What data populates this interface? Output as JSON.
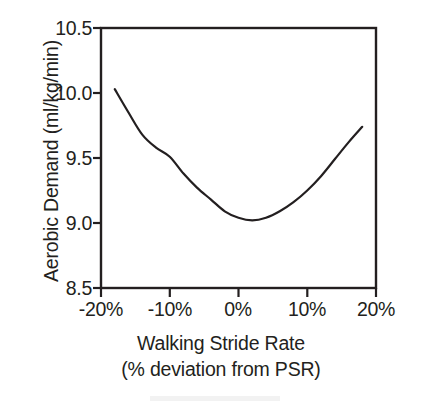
{
  "chart_data": {
    "type": "line",
    "title": "",
    "xlabel": "Walking Stride Rate (% deviation from PSR)",
    "xlabel_line1": "Walking Stride Rate",
    "xlabel_line2": "(% deviation from PSR)",
    "ylabel": "Aerobic Demand (ml/kg/min)",
    "xlim": [
      -20,
      20
    ],
    "ylim": [
      8.5,
      10.5
    ],
    "xticks": [
      -20,
      -10,
      0,
      10,
      20
    ],
    "xtick_labels": [
      "-20%",
      "-10%",
      "0%",
      "10%",
      "20%"
    ],
    "yticks": [
      8.5,
      9.0,
      9.5,
      10.0,
      10.5
    ],
    "ytick_labels": [
      "8.5",
      "9.0",
      "9.5",
      "10.0",
      "10.5"
    ],
    "grid": false,
    "legend": false,
    "line_color": "#231f20",
    "line_width_px": 2.2,
    "series": [
      {
        "name": "Aerobic demand",
        "x": [
          -18,
          -16,
          -14,
          -12,
          -10,
          -8,
          -6,
          -4,
          -2,
          0,
          2,
          4,
          6,
          8,
          10,
          12,
          14,
          16,
          18
        ],
        "y": [
          10.03,
          9.85,
          9.68,
          9.58,
          9.51,
          9.38,
          9.27,
          9.18,
          9.09,
          9.04,
          9.02,
          9.04,
          9.09,
          9.16,
          9.25,
          9.36,
          9.49,
          9.62,
          9.74
        ]
      }
    ],
    "annotations": {
      "minimum_x_percent": 2,
      "minimum_y": 9.02
    }
  },
  "axes": {
    "y_title": "Aerobic Demand (ml/kg/min)",
    "x_title_line1": "Walking Stride Rate",
    "x_title_line2": "(% deviation from PSR)",
    "y_tick_labels": [
      "10.5",
      "10.0",
      "9.5",
      "9.0",
      "8.5"
    ],
    "x_tick_labels": [
      "-20%",
      "-10%",
      "0%",
      "10%",
      "20%"
    ]
  },
  "colors": {
    "ink": "#231f20",
    "background": "#ffffff"
  }
}
